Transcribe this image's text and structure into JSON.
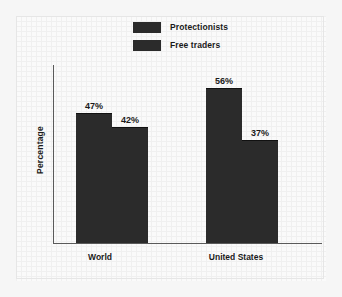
{
  "chart_data": {
    "type": "bar",
    "title": "",
    "subtitle": "",
    "xlabel": "",
    "ylabel": "Percentage",
    "categories": [
      "World",
      "United States"
    ],
    "series": [
      {
        "name": "Protectionists",
        "values": [
          47,
          42
        ],
        "color": "#2b2b2b"
      },
      {
        "name": "Free traders",
        "values": [
          56,
          37
        ],
        "color": "#2b2b2b"
      }
    ],
    "grouped_values": [
      {
        "category": "World",
        "bars": [
          {
            "label": "47%",
            "value": 47
          },
          {
            "label": "42%",
            "value": 42
          }
        ]
      },
      {
        "category": "United States",
        "bars": [
          {
            "label": "56%",
            "value": 56
          },
          {
            "label": "37%",
            "value": 37
          }
        ]
      }
    ],
    "data_labels": [
      "47%",
      "42%",
      "56%",
      "37%"
    ],
    "ylim": [
      0,
      66
    ],
    "grid": true,
    "grid_style": "graph-paper",
    "legend_position": "top-center",
    "axis_color": "#5a5a5a",
    "background_color": "#f6f6f6"
  },
  "legend": {
    "items": [
      {
        "label": "Protectionists",
        "swatch_icon": "legend-swatch-icon"
      },
      {
        "label": "Free traders",
        "swatch_icon": "legend-swatch-icon"
      }
    ]
  },
  "axes": {
    "y_title": "Percentage",
    "category_labels": [
      "World",
      "United States"
    ]
  }
}
